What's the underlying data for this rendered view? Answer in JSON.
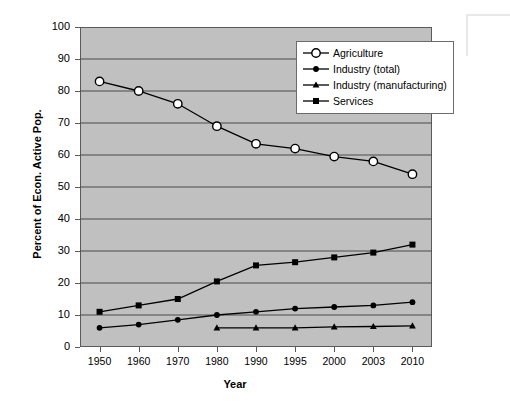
{
  "chart_data": {
    "type": "line",
    "title": "",
    "xlabel": "Year",
    "ylabel": "Percent of Econ. Active Pop.",
    "categories": [
      "1950",
      "1960",
      "1970",
      "1980",
      "1990",
      "1995",
      "2000",
      "2003",
      "2010"
    ],
    "ylim": [
      0,
      100
    ],
    "ytick_step": 10,
    "yticks": [
      "0",
      "10",
      "20",
      "30",
      "40",
      "50",
      "60",
      "70",
      "80",
      "90",
      "100"
    ],
    "grid": "horizontal",
    "legend_position": "top-right-inside",
    "plot_background": "#c0c0c0",
    "series": [
      {
        "name": "Agriculture",
        "marker": "open-circle",
        "color": "#000000",
        "values": [
          83,
          80,
          76,
          69,
          63.5,
          62,
          59.5,
          58,
          54
        ]
      },
      {
        "name": "Industry (total)",
        "marker": "filled-circle",
        "color": "#000000",
        "values": [
          6,
          7,
          8.5,
          10,
          11,
          12,
          12.5,
          13,
          14
        ]
      },
      {
        "name": "Industry (manufacturing)",
        "marker": "filled-triangle",
        "color": "#000000",
        "values": [
          null,
          null,
          null,
          6,
          6,
          6,
          6.3,
          6.4,
          6.6
        ]
      },
      {
        "name": "Services",
        "marker": "filled-square",
        "color": "#000000",
        "values": [
          11,
          13,
          15,
          20.5,
          25.5,
          26.5,
          28,
          29.5,
          32
        ]
      }
    ]
  }
}
